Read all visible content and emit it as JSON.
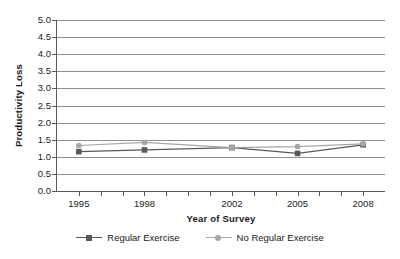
{
  "chart_data": {
    "type": "line",
    "title": "",
    "xlabel": "Year of Survey",
    "ylabel": "Productivity Loss",
    "x": [
      1995,
      1998,
      2002,
      2005,
      2008
    ],
    "categories": [
      "1995",
      "1998",
      "2002",
      "2005",
      "2008"
    ],
    "xlim": [
      1994,
      2009
    ],
    "ylim": [
      0.0,
      5.0
    ],
    "ytick_labels": [
      "0.0",
      "0.5",
      "1.0",
      "1.5",
      "2.0",
      "2.5",
      "3.0",
      "3.5",
      "4.0",
      "4.5",
      "5.0"
    ],
    "ytick_values": [
      0.0,
      0.5,
      1.0,
      1.5,
      2.0,
      2.5,
      3.0,
      3.5,
      4.0,
      4.5,
      5.0
    ],
    "xtick_labels": [
      "1995",
      "1998",
      "2002",
      "2005",
      "2008"
    ],
    "xtick_minor_values": [
      1995,
      1996,
      1997,
      1998,
      1999,
      2000,
      2001,
      2002,
      2003,
      2004,
      2005,
      2006,
      2007,
      2008
    ],
    "grid": "horizontal",
    "legend_position": "bottom",
    "series": [
      {
        "name": "Regular Exercise",
        "values": [
          1.15,
          1.2,
          1.27,
          1.1,
          1.35
        ],
        "color": "#595959",
        "marker": "square"
      },
      {
        "name": "No Regular Exercise",
        "values": [
          1.33,
          1.42,
          1.27,
          1.3,
          1.38
        ],
        "color": "#a6a6a6",
        "marker": "circle"
      }
    ]
  },
  "legend": {
    "entries": [
      {
        "label": "Regular Exercise"
      },
      {
        "label": "No Regular Exercise"
      }
    ]
  },
  "colors": {
    "axis": "#5a5a5a",
    "grid": "#8f8f8f",
    "series_1": "#595959",
    "series_2": "#a6a6a6",
    "background": "#ffffff"
  }
}
